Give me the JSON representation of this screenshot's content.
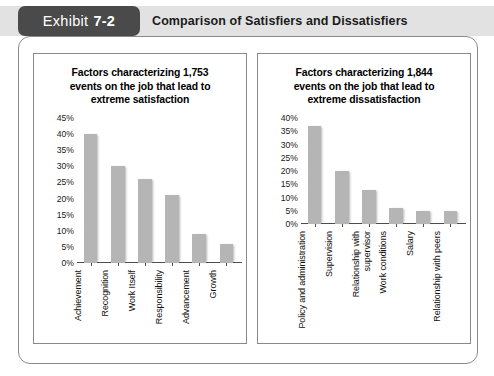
{
  "header": {
    "tab_label": "Exhibit",
    "tab_number": "7-2",
    "title": "Comparison of Satisfiers and Dissatisfiers"
  },
  "colors": {
    "tab_background": "#4a4a4a",
    "header_band": "#e2e2e2",
    "bar_fill": "#b5b5b5",
    "axis": "#4d4d4d",
    "frame_border": "#8a8a8a"
  },
  "chart_data": [
    {
      "type": "bar",
      "name": "satisfiers",
      "title": "Factors characterizing 1,753 events on the job that lead to extreme satisfaction",
      "title_lines": [
        "Factors characterizing 1,753",
        "events on the job that lead to",
        "extreme satisfaction"
      ],
      "categories": [
        "Achievement",
        "Recognition",
        "Work Itself",
        "Responsibility",
        "Advancement",
        "Growth"
      ],
      "values": [
        40,
        30,
        26,
        21,
        9,
        6
      ],
      "xlabel": "",
      "ylabel": "",
      "ylim": [
        0,
        45
      ],
      "ytick_step": 5,
      "yticks": [
        "0%",
        "5%",
        "10%",
        "15%",
        "20%",
        "25%",
        "30%",
        "35%",
        "40%",
        "45%"
      ],
      "grid": false,
      "legend": "none"
    },
    {
      "type": "bar",
      "name": "dissatisfiers",
      "title": "Factors characterizing 1,844 events on the job that lead to extreme dissatisfaction",
      "title_lines": [
        "Factors characterizing 1,844",
        "events on the job that lead to",
        "extreme dissatisfaction"
      ],
      "categories": [
        "Policy and administration",
        "Supervision",
        "Relationship with supervisor",
        "Work conditions",
        "Salary",
        "Relationship with peers"
      ],
      "values": [
        37,
        20,
        13,
        6,
        5,
        5
      ],
      "xlabel": "",
      "ylabel": "",
      "ylim": [
        0,
        40
      ],
      "ytick_step": 5,
      "yticks": [
        "0%",
        "5%",
        "10%",
        "15%",
        "20%",
        "25%",
        "30%",
        "35%",
        "40%"
      ],
      "grid": false,
      "legend": "none"
    }
  ]
}
